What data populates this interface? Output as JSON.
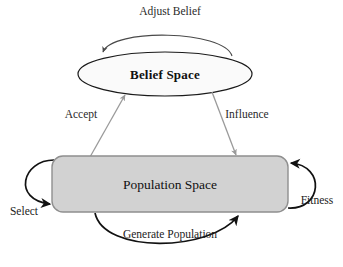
{
  "diagram": {
    "background_color": "#ffffff",
    "nodes": [
      {
        "id": "belief-space",
        "label": "Belief Space",
        "shape": "ellipse",
        "fill_color": "#fafafa",
        "stroke_color": "#1a1a1a",
        "bold": true,
        "cx": 165,
        "cy": 74,
        "rx": 87,
        "ry": 22
      },
      {
        "id": "population-space",
        "label": "Population Space",
        "shape": "rounded-rectangle",
        "fill_color": "#d2d2d2",
        "stroke_color": "#8f8f8f",
        "bold": false,
        "x": 52,
        "y": 156,
        "width": 236,
        "height": 56,
        "corner_radius": 11
      }
    ],
    "edges": [
      {
        "id": "adjust-belief",
        "label": "Adjust Belief",
        "from": "belief-space",
        "to": "belief-space",
        "kind": "self-loop-top",
        "color": "#4a4a4a",
        "label_x": 170,
        "label_y": 15
      },
      {
        "id": "accept",
        "label": "Accept",
        "from": "population-space",
        "to": "belief-space",
        "kind": "straight",
        "color": "#9a9a9a",
        "label_x": 81,
        "label_y": 118
      },
      {
        "id": "influence",
        "label": "Influence",
        "from": "belief-space",
        "to": "population-space",
        "kind": "straight",
        "color": "#9a9a9a",
        "label_x": 247,
        "label_y": 118
      },
      {
        "id": "select",
        "label": "Select",
        "from": "population-space",
        "to": "population-space",
        "kind": "self-loop-left",
        "color": "#111111",
        "label_x": 24,
        "label_y": 215
      },
      {
        "id": "fitness",
        "label": "Fitness",
        "from": "population-space",
        "to": "population-space",
        "kind": "self-loop-right",
        "color": "#111111",
        "label_x": 317,
        "label_y": 204
      },
      {
        "id": "generate-population",
        "label": "Generate Population",
        "from": "population-space",
        "to": "population-space",
        "kind": "self-loop-bottom",
        "color": "#111111",
        "label_x": 170,
        "label_y": 237
      }
    ]
  }
}
